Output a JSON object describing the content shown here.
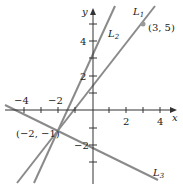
{
  "figure": {
    "type": "coordinate-plane-lines",
    "axes": {
      "x_label": "x",
      "y_label": "y",
      "x_ticks": [
        "-4",
        "-2",
        "2",
        "4"
      ],
      "y_ticks": [
        "4",
        "2",
        "-2"
      ],
      "x_range": [
        -5,
        5
      ],
      "y_range": [
        -4,
        6
      ]
    },
    "lines": [
      {
        "name": "L",
        "sub": "1",
        "slope": "6/5",
        "through": [
          [
            -2,
            -1
          ],
          [
            3,
            5
          ]
        ]
      },
      {
        "name": "L",
        "sub": "2",
        "slope": "2",
        "through": [
          [
            -2,
            -1
          ],
          [
            0,
            3
          ]
        ]
      },
      {
        "name": "L",
        "sub": "3",
        "slope": "-1/2",
        "through": [
          [
            -2,
            -1
          ],
          [
            0,
            -2
          ]
        ]
      }
    ],
    "points": [
      {
        "label": "(3, 5)",
        "x": 3,
        "y": 5
      },
      {
        "label": "(−2, −1)",
        "x": -2,
        "y": -1
      }
    ],
    "colors": {
      "line": "#8a8a8a",
      "axis": "#333333",
      "text": "#222222",
      "point": "#9a9a9a"
    }
  },
  "labels": {
    "x_axis": "x",
    "y_axis": "y",
    "tick_x_m4": "−4",
    "tick_x_m2": "−2",
    "tick_x_2": "2",
    "tick_x_4": "4",
    "tick_y_4": "4",
    "tick_y_2": "2",
    "tick_y_m2": "−2",
    "L1": "L",
    "L1_sub": "1",
    "L2": "L",
    "L2_sub": "2",
    "L3": "L",
    "L3_sub": "3",
    "point_a": "(3, 5)",
    "point_b": "(−2, −1)"
  }
}
